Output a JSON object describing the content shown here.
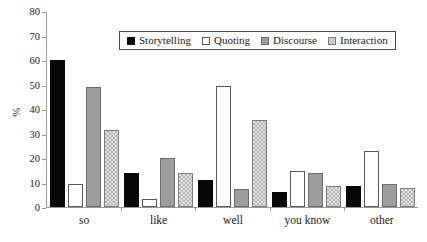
{
  "chart_data": {
    "type": "bar",
    "title": "",
    "subtitle": "",
    "xlabel": "",
    "ylabel": "%",
    "ylim": [
      0,
      80
    ],
    "ytick_step": 10,
    "yticks": [
      80,
      70,
      60,
      50,
      40,
      30,
      20,
      10,
      0
    ],
    "grid": false,
    "legend_position": "top-center-inside",
    "categories": [
      "so",
      "like",
      "well",
      "you know",
      "other"
    ],
    "series": [
      {
        "name": "Storytelling",
        "swatch": "solid-black",
        "color": "#080808",
        "values": [
          60,
          14,
          11,
          6.2,
          8.6
        ]
      },
      {
        "name": "Quoting",
        "swatch": "open-white",
        "color": "#ffffff",
        "values": [
          9.5,
          3.3,
          49.5,
          14.7,
          23
        ]
      },
      {
        "name": "Discourse",
        "swatch": "solid-gray",
        "color": "#9d9d9d",
        "values": [
          49,
          20,
          7.5,
          13.8,
          9.2
        ]
      },
      {
        "name": "Interaction",
        "swatch": "checkered-light-gray",
        "color": "#e3e3e3",
        "values": [
          31.5,
          13.8,
          35.5,
          8.7,
          7.8
        ]
      }
    ]
  }
}
